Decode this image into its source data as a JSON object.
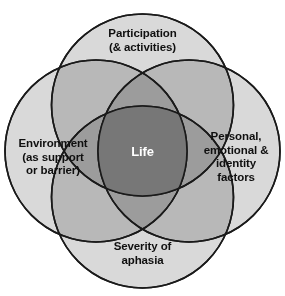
{
  "figure": {
    "type": "venn-diagram",
    "background_color": "#ffffff",
    "stroke_color": "#1a1a1a",
    "circle_fill_color": "#d9d9d9",
    "core_fill_color": "#777777",
    "core_label_color": "#ffffff",
    "label_color": "#101010"
  },
  "circles": [
    {
      "id": "participation",
      "position": "top",
      "label": "Participation\n(& activities)"
    },
    {
      "id": "environment",
      "position": "left",
      "label": "Environment\n(as support\nor barrier)"
    },
    {
      "id": "personal",
      "position": "right",
      "label": "Personal,\nemotional &\nidentity\nfactors"
    },
    {
      "id": "severity",
      "position": "bottom",
      "label": "Severity of\naphasia"
    }
  ],
  "core": {
    "id": "life",
    "label": "Life"
  }
}
